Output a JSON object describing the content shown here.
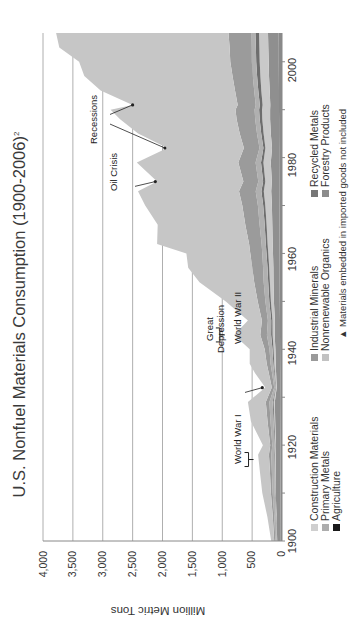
{
  "chart_data": {
    "type": "area",
    "stacked": true,
    "title": "U.S. Nonfuel Materials Consumption (1900-2006)",
    "title_footnote": "2",
    "xlabel": "",
    "ylabel": "Million Metric Tons",
    "xlim": [
      1900,
      2006
    ],
    "ylim": [
      0,
      4000
    ],
    "yticks": [
      "0",
      "500",
      "1,000",
      "1,500",
      "2,000",
      "2,500",
      "3,000",
      "3,500",
      "4,000"
    ],
    "xticks": [
      "1900",
      "1920",
      "1940",
      "1960",
      "1980",
      "2000"
    ],
    "grid": "horizontal",
    "orientation_note": "figure rotated 90 degrees counter-clockwise",
    "x": [
      1900,
      1905,
      1910,
      1915,
      1918,
      1920,
      1925,
      1929,
      1932,
      1935,
      1937,
      1940,
      1943,
      1946,
      1950,
      1954,
      1957,
      1960,
      1962,
      1966,
      1970,
      1973,
      1975,
      1979,
      1982,
      1985,
      1988,
      1990,
      1991,
      1994,
      1997,
      2000,
      2003,
      2006
    ],
    "series": [
      {
        "name": "Agriculture",
        "color": "#1a1a1a",
        "values": [
          20,
          22,
          24,
          26,
          27,
          27,
          29,
          30,
          28,
          29,
          30,
          31,
          33,
          34,
          36,
          38,
          39,
          40,
          41,
          42,
          44,
          45,
          45,
          47,
          47,
          48,
          49,
          50,
          50,
          51,
          52,
          53,
          54,
          55
        ]
      },
      {
        "name": "Forestry Products",
        "color": "#8c8c8c",
        "values": [
          60,
          70,
          80,
          80,
          80,
          75,
          85,
          90,
          60,
          70,
          75,
          80,
          90,
          85,
          100,
          105,
          105,
          110,
          115,
          120,
          125,
          135,
          125,
          140,
          120,
          140,
          150,
          150,
          145,
          155,
          165,
          170,
          175,
          180
        ]
      },
      {
        "name": "Nonrenewable Organics",
        "color": "#c8c8c8",
        "values": [
          5,
          6,
          8,
          9,
          10,
          10,
          15,
          20,
          15,
          20,
          25,
          30,
          35,
          40,
          50,
          60,
          70,
          80,
          85,
          95,
          110,
          125,
          110,
          125,
          110,
          120,
          130,
          135,
          130,
          140,
          145,
          150,
          150,
          150
        ]
      },
      {
        "name": "Recycled Metals",
        "color": "#7a7a7a",
        "values": [
          5,
          6,
          8,
          10,
          12,
          10,
          14,
          16,
          8,
          12,
          16,
          18,
          25,
          22,
          26,
          28,
          28,
          30,
          30,
          33,
          35,
          40,
          36,
          40,
          35,
          40,
          45,
          48,
          46,
          50,
          55,
          58,
          58,
          60
        ]
      },
      {
        "name": "Primary Metals",
        "color": "#a0a0a0",
        "values": [
          20,
          25,
          35,
          45,
          50,
          40,
          50,
          55,
          20,
          35,
          45,
          50,
          70,
          55,
          65,
          75,
          75,
          70,
          70,
          85,
          90,
          95,
          80,
          90,
          65,
          70,
          75,
          75,
          70,
          70,
          72,
          75,
          70,
          70
        ]
      },
      {
        "name": "Industrial Minerals",
        "color": "#9a9a9a",
        "values": [
          20,
          25,
          30,
          35,
          40,
          35,
          50,
          60,
          40,
          55,
          65,
          80,
          110,
          100,
          130,
          160,
          180,
          200,
          210,
          240,
          260,
          280,
          250,
          290,
          260,
          290,
          310,
          320,
          300,
          320,
          340,
          360,
          370,
          380
        ]
      },
      {
        "name": "Construction Materials",
        "color": "#c4c4c4",
        "values": [
          50,
          90,
          145,
          170,
          181,
          123,
          277,
          299,
          109,
          229,
          284,
          251,
          437,
          234,
          533,
          914,
          1073,
          1070,
          1539,
          1465,
          1626,
          1690,
          1444,
          1698,
          1283,
          1700,
          1950,
          2090,
          1759,
          2250,
          2480,
          2530,
          2850,
          2885
        ]
      }
    ],
    "totals_approx": [
      180,
      244,
      330,
      375,
      400,
      320,
      520,
      570,
      280,
      450,
      540,
      540,
      800,
      570,
      940,
      1380,
      1570,
      1600,
      2090,
      2080,
      2290,
      2410,
      2090,
      2430,
      1920,
      2410,
      2710,
      2870,
      2500,
      3040,
      3310,
      3400,
      3680,
      3780
    ],
    "legend": [
      "Construction Materials",
      "Primary Metals",
      "Agriculture",
      "Industrial Minerals",
      "Nonrenewable Organics",
      "Recycled Metals",
      "Forestry Products"
    ],
    "legend_position": "bottom",
    "annotations": [
      {
        "text": "World War I",
        "x": 1917
      },
      {
        "text": "Great Depression",
        "x": 1932
      },
      {
        "text": "World War II",
        "x": 1943
      },
      {
        "text": "Oil Crisis",
        "x": 1975
      },
      {
        "text": "Recessions",
        "x": [
          1982,
          1991
        ]
      }
    ],
    "footnote": "▲ Materials embedded in imported goods not included"
  },
  "title": {
    "main": "U.S. Nonfuel Materials Consumption (1900-2006)",
    "sup": "2"
  },
  "axes": {
    "ylabel": "Million Metric Tons",
    "yticks": [
      "0",
      "500",
      "1,000",
      "1,500",
      "2,000",
      "2,500",
      "3,000",
      "3,500",
      "4,000"
    ],
    "xticks": [
      "1900",
      "1920",
      "1940",
      "1960",
      "1980",
      "2000"
    ]
  },
  "legend": {
    "col1": [
      {
        "label": "Construction Materials",
        "color": "#c8c8c8"
      },
      {
        "label": "Primary Metals",
        "color": "#a8a8a8"
      },
      {
        "label": "Agriculture",
        "color": "#1a1a1a"
      }
    ],
    "col2": [
      {
        "label": "Industrial Minerals",
        "color": "#9a9a9a"
      },
      {
        "label": "Nonrenewable Organics",
        "color": "#bdbdbd"
      }
    ],
    "col3": [
      {
        "label": "Recycled Metals",
        "color": "#777777"
      },
      {
        "label": "Forestry Products",
        "color": "#8c8c8c"
      }
    ],
    "note": "▲ Materials embedded in imported goods not included"
  },
  "annotations": {
    "ww1": "World War I",
    "depression_1": "Great",
    "depression_2": "Depression",
    "ww2": "World War II",
    "oil": "Oil Crisis",
    "recessions": "Recessions"
  }
}
